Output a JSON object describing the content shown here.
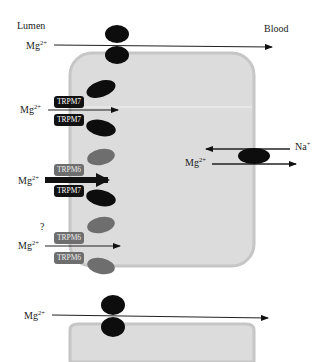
{
  "diagram": {
    "compartments": {
      "lumen_label": "Lumen",
      "blood_label": "Blood"
    },
    "ion_labels": {
      "mg_base": "Mg",
      "mg_charge": "2+",
      "na_base": "Na",
      "na_charge": "+"
    },
    "pathways": [
      {
        "id": "paracellular-top",
        "ion": "Mg2+",
        "direction": "lumen-to-blood",
        "via": "tight junction"
      },
      {
        "id": "trpm7-homomer",
        "ion": "Mg2+",
        "channels": [
          "TRPM7",
          "TRPM7"
        ],
        "direction": "into cell"
      },
      {
        "id": "trpm6-trpm7-heteromer",
        "ion": "Mg2+",
        "channels": [
          "TRPM6",
          "TRPM7"
        ],
        "direction": "into cell",
        "emphasis": "thick arrow"
      },
      {
        "id": "trpm6-homomer",
        "ion": "Mg2+",
        "channels": [
          "TRPM6",
          "TRPM6"
        ],
        "direction": "into cell",
        "annotation": "?"
      },
      {
        "id": "na-mg-exchanger",
        "ions": [
          "Na+",
          "Mg2+"
        ],
        "direction": "Na+ in, Mg2+ out to blood"
      },
      {
        "id": "paracellular-bottom",
        "ion": "Mg2+",
        "direction": "lumen-to-blood",
        "via": "tight junction"
      }
    ],
    "channel_tags": {
      "trpm7": "TRPM7",
      "trpm6": "TRPM6"
    },
    "question_mark": "?",
    "colors": {
      "cell_fill": "#dcdcdc",
      "cell_border": "#c4c4c4",
      "trpm7": "#111111",
      "trpm6": "#6e6e6e",
      "arrow": "#111111"
    }
  }
}
